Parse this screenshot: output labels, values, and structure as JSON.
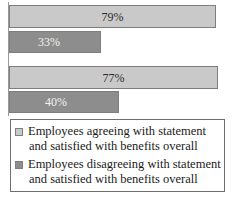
{
  "chart_data": {
    "type": "bar",
    "orientation": "horizontal",
    "title": "",
    "xlabel": "",
    "ylabel": "",
    "grid": false,
    "axis_visible": "category-axis-only",
    "xlim": [
      0,
      100
    ],
    "categories": [
      "Statement group 1",
      "Statement group 2"
    ],
    "series": [
      {
        "name": "Employees agreeing with statement and satisfied with benefits overall",
        "color": "#c9c9c9",
        "values": [
          79,
          77
        ],
        "labels": [
          "79%",
          "77%"
        ]
      },
      {
        "name": "Employees disagreeing with statement and satisfied with benefits overall",
        "color": "#8d8d8d",
        "values": [
          33,
          40
        ],
        "labels": [
          "33%",
          "40%"
        ]
      }
    ],
    "bars": [
      {
        "label": "79%",
        "value": 79,
        "series": 0,
        "group": 0,
        "style": "light"
      },
      {
        "label": "33%",
        "value": 33,
        "series": 1,
        "group": 0,
        "style": "dark"
      },
      {
        "label": "77%",
        "value": 77,
        "series": 0,
        "group": 1,
        "style": "light"
      },
      {
        "label": "40%",
        "value": 40,
        "series": 1,
        "group": 1,
        "style": "dark"
      }
    ],
    "legend": {
      "position": "bottom",
      "entries": [
        {
          "style": "light",
          "line1": "Employees agreeing with statement",
          "line2": "and satisfied with benefits overall"
        },
        {
          "style": "dark",
          "line1": "Employees disagreeing with statement",
          "line2": "and satisfied with benefits overall"
        }
      ]
    }
  },
  "colors": {
    "series_light": "#c9c9c9",
    "series_dark": "#8d8d8d",
    "bar_border": "#7e7e7e",
    "axis": "#9a9a9a",
    "legend_border": "#6f6f6f",
    "text_dark": "#1a1a1a",
    "text_on_dark_bar": "#f2f2f2",
    "background": "#ffffff"
  }
}
